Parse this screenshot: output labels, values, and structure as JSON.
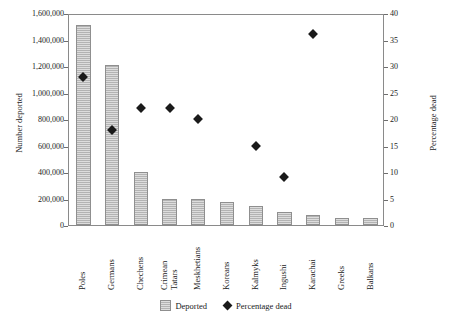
{
  "chart_data": {
    "type": "bar",
    "title": "",
    "subtitle": "",
    "xlabel": "",
    "ylabel": "Number deported",
    "y2label": "Percentage dead",
    "ylim": [
      0,
      1600000
    ],
    "y2lim": [
      0,
      40
    ],
    "grid": false,
    "legend_position": "bottom-center",
    "categories": [
      "Poles",
      "Germans",
      "Chechens",
      "Crimean Tatars",
      "Meskhetians",
      "Koreans",
      "Kalmyks",
      "Ingushi",
      "Karachai",
      "Greeks",
      "Balkans"
    ],
    "series": [
      {
        "name": "Deported",
        "axis": "left",
        "type": "bar",
        "values": [
          1510000,
          1210000,
          400000,
          200000,
          200000,
          175000,
          140000,
          95000,
          75000,
          55000,
          50000
        ]
      },
      {
        "name": "Percentage dead",
        "axis": "right",
        "type": "scatter",
        "values": [
          28.0,
          18.0,
          22.0,
          22.0,
          20.0,
          null,
          15.0,
          9.0,
          36.0,
          null,
          null
        ]
      }
    ],
    "y_ticks_left": [
      "0",
      "200,000",
      "400,000",
      "600,000",
      "800,000",
      "1,000,000",
      "1,200,000",
      "1,400,000",
      "1,600,000"
    ],
    "y_ticks_right": [
      "0",
      "5",
      "10",
      "15",
      "20",
      "25",
      "30",
      "35",
      "40"
    ]
  },
  "legend": {
    "items": [
      {
        "label": "Deported",
        "marker": "bar-swatch"
      },
      {
        "label": "Percentage dead",
        "marker": "diamond-marker"
      }
    ]
  },
  "colors": {
    "bar_fill": "#b3b3b3",
    "bar_stroke": "#8f8f8f",
    "marker": "#1a1a1a",
    "axis": "#8a8a8a",
    "text": "#1a1a1a",
    "background": "#ffffff"
  }
}
